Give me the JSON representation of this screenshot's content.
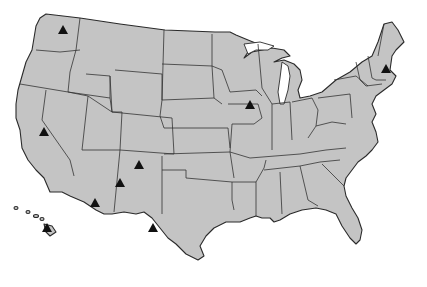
{
  "map": {
    "title": "",
    "region": "United States",
    "background_color": "#ffffff",
    "land_color": "#c4c4c4",
    "border_color": "#2a2a2a",
    "marker_color": "#111111",
    "marker_shape": "triangle",
    "markers": [
      {
        "state": "Washington",
        "x": 63,
        "y": 31
      },
      {
        "state": "California",
        "x": 44,
        "y": 133
      },
      {
        "state": "Iowa",
        "x": 250,
        "y": 106
      },
      {
        "state": "New Hampshire",
        "x": 386,
        "y": 70
      },
      {
        "state": "New Mexico",
        "x": 139,
        "y": 166
      },
      {
        "state": "New Mexico (west)",
        "x": 120,
        "y": 184
      },
      {
        "state": "Arizona",
        "x": 95,
        "y": 204
      },
      {
        "state": "Texas",
        "x": 153,
        "y": 229
      },
      {
        "state": "Hawaii",
        "x": 47,
        "y": 229
      }
    ]
  }
}
